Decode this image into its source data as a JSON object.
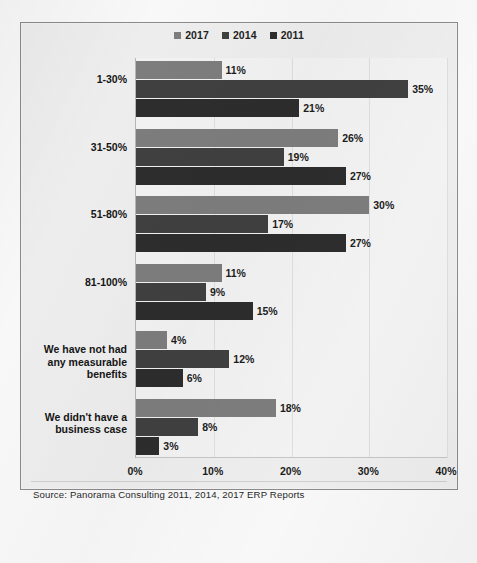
{
  "source_note": "Source: Panorama Consulting 2011, 2014, 2017 ERP Reports",
  "colors": {
    "series_2017": "#7f7f7f",
    "series_2014": "#414141",
    "series_2011": "#2e2e2e",
    "frame_border": "#8d8d8d",
    "plot_background": "#f7f7f7",
    "gridline": "#e2e2e2"
  },
  "chart_data": {
    "type": "bar",
    "orientation": "horizontal",
    "title": "",
    "subtitle": "",
    "xlabel": "",
    "ylabel": "",
    "xlim": [
      0,
      40
    ],
    "xticks": [
      "0%",
      "10%",
      "20%",
      "30%",
      "40%"
    ],
    "xtick_values": [
      0,
      10,
      20,
      30,
      40
    ],
    "grid": true,
    "legend_position": "top-center",
    "categories": [
      "1-30%",
      "31-50%",
      "51-80%",
      "81-100%",
      "We have not had any measurable benefits",
      "We didn't have a business case"
    ],
    "series": [
      {
        "name": "2017",
        "color": "#7f7f7f",
        "values": [
          11,
          26,
          30,
          11,
          4,
          18
        ],
        "labels": [
          "11%",
          "26%",
          "30%",
          "11%",
          "4%",
          "18%"
        ]
      },
      {
        "name": "2014",
        "color": "#414141",
        "values": [
          35,
          19,
          17,
          9,
          12,
          8
        ],
        "labels": [
          "35%",
          "19%",
          "17%",
          "9%",
          "12%",
          "8%"
        ]
      },
      {
        "name": "2011",
        "color": "#2e2e2e",
        "values": [
          21,
          27,
          27,
          15,
          6,
          3
        ],
        "labels": [
          "21%",
          "27%",
          "27%",
          "15%",
          "6%",
          "3%"
        ]
      }
    ]
  }
}
